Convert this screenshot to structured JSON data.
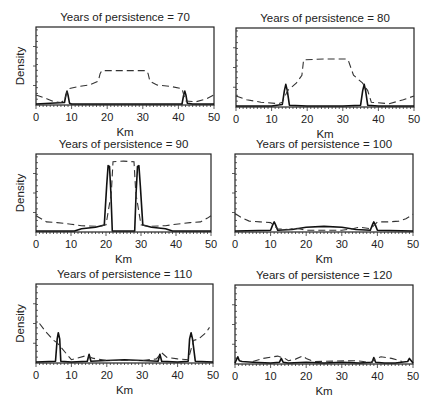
{
  "figure": {
    "xlabel": "Km",
    "ylabel": "Density",
    "xticks": [
      0,
      10,
      20,
      30,
      40,
      50
    ],
    "xlim": [
      0,
      50
    ]
  },
  "chart_data": [
    {
      "type": "line",
      "title": "Years of persistence = 70",
      "xlabel": "Km",
      "ylabel": "Density",
      "xlim": [
        0,
        50
      ],
      "ylim": [
        0,
        1
      ],
      "series": [
        {
          "name": "solid",
          "style": "solid",
          "x": [
            0,
            4,
            8,
            8.4,
            8.7,
            9.0,
            9.4,
            10,
            20,
            30,
            41,
            41.5,
            41.8,
            42.1,
            42.5,
            44,
            50
          ],
          "values": [
            0.0,
            0.01,
            0.02,
            0.12,
            0.17,
            0.12,
            0.01,
            0.0,
            0.0,
            0.0,
            0.0,
            0.12,
            0.17,
            0.12,
            0.01,
            0.0,
            0.0
          ]
        },
        {
          "name": "dashed",
          "style": "dashed",
          "x": [
            0,
            3,
            5,
            7,
            8,
            9,
            12,
            15,
            17.5,
            18,
            18.5,
            25,
            31,
            31.5,
            32,
            34,
            38,
            41,
            42,
            45,
            48,
            50
          ],
          "values": [
            0.12,
            0.07,
            0.03,
            0.02,
            0.05,
            0.2,
            0.23,
            0.25,
            0.3,
            0.4,
            0.44,
            0.44,
            0.44,
            0.4,
            0.3,
            0.25,
            0.23,
            0.2,
            0.04,
            0.03,
            0.07,
            0.12
          ]
        }
      ]
    },
    {
      "type": "line",
      "title": "Years of persistence = 80",
      "xlabel": "Km",
      "ylabel": "",
      "xlim": [
        0,
        50
      ],
      "ylim": [
        0,
        1
      ],
      "series": [
        {
          "name": "solid",
          "style": "solid",
          "x": [
            0,
            10,
            13,
            13.6,
            14,
            14.4,
            15,
            20,
            30,
            35,
            35.6,
            36,
            36.4,
            37,
            40,
            50
          ],
          "values": [
            0.0,
            0.0,
            0.02,
            0.2,
            0.28,
            0.2,
            0.01,
            0.0,
            0.0,
            0.01,
            0.2,
            0.28,
            0.2,
            0.01,
            0.0,
            0.0
          ]
        },
        {
          "name": "dashed",
          "style": "dashed",
          "x": [
            0,
            3,
            7,
            12,
            13,
            14.5,
            17,
            18.5,
            19,
            25,
            31,
            31.5,
            33,
            35.5,
            37,
            38,
            43,
            47,
            50
          ],
          "values": [
            0.13,
            0.08,
            0.05,
            0.03,
            0.05,
            0.2,
            0.3,
            0.4,
            0.6,
            0.61,
            0.61,
            0.6,
            0.4,
            0.3,
            0.2,
            0.05,
            0.03,
            0.08,
            0.13
          ]
        }
      ]
    },
    {
      "type": "line",
      "title": "Years of persistence = 90",
      "xlabel": "Km",
      "ylabel": "Density",
      "xlim": [
        0,
        50
      ],
      "ylim": [
        0,
        1
      ],
      "series": [
        {
          "name": "solid",
          "style": "solid",
          "x": [
            0,
            11,
            13,
            17,
            19.5,
            20.2,
            20.6,
            21.0,
            21.4,
            21.8,
            25,
            28.2,
            28.6,
            29.0,
            29.4,
            29.8,
            30.5,
            33,
            37,
            39,
            50
          ],
          "values": [
            0.0,
            0.0,
            0.03,
            0.05,
            0.08,
            0.6,
            0.86,
            0.85,
            0.5,
            0.0,
            0.0,
            0.0,
            0.5,
            0.85,
            0.86,
            0.6,
            0.08,
            0.05,
            0.03,
            0.0,
            0.0
          ]
        },
        {
          "name": "dashed",
          "style": "dashed",
          "x": [
            0,
            3,
            6,
            10,
            13,
            18,
            20,
            21.5,
            22,
            25,
            28,
            28.5,
            30,
            32,
            37,
            40,
            44,
            47,
            49,
            50
          ],
          "values": [
            0.2,
            0.12,
            0.11,
            0.09,
            0.07,
            0.06,
            0.08,
            0.5,
            0.91,
            0.92,
            0.91,
            0.5,
            0.08,
            0.06,
            0.07,
            0.09,
            0.11,
            0.12,
            0.17,
            0.2
          ]
        }
      ]
    },
    {
      "type": "line",
      "title": "Years of persistence = 100",
      "xlabel": "Km",
      "ylabel": "",
      "xlim": [
        0,
        50
      ],
      "ylim": [
        0,
        1
      ],
      "series": [
        {
          "name": "solid",
          "style": "solid",
          "x": [
            0,
            10,
            10.6,
            11,
            11.4,
            12,
            16,
            20,
            25,
            30,
            34,
            38,
            38.6,
            39,
            39.4,
            40,
            50
          ],
          "values": [
            0.0,
            0.01,
            0.08,
            0.12,
            0.08,
            0.01,
            0.02,
            0.05,
            0.06,
            0.05,
            0.02,
            0.01,
            0.08,
            0.12,
            0.08,
            0.01,
            0.0
          ]
        },
        {
          "name": "dashed",
          "style": "dashed",
          "x": [
            0,
            2,
            4,
            7,
            10,
            11,
            12,
            15,
            17,
            20,
            30,
            33,
            35,
            38,
            39,
            40,
            43,
            46,
            48,
            50
          ],
          "values": [
            0.23,
            0.17,
            0.13,
            0.12,
            0.11,
            0.07,
            0.03,
            0.02,
            0.04,
            0.01,
            0.01,
            0.03,
            0.05,
            0.03,
            0.07,
            0.12,
            0.12,
            0.13,
            0.16,
            0.22
          ]
        }
      ]
    },
    {
      "type": "line",
      "title": "Years of persistence = 110",
      "xlabel": "Km",
      "ylabel": "Density",
      "xlim": [
        0,
        50
      ],
      "ylim": [
        0,
        1
      ],
      "series": [
        {
          "name": "solid",
          "style": "solid",
          "x": [
            0,
            5.5,
            6,
            6.3,
            6.7,
            7,
            10,
            14.5,
            15,
            15.5,
            20,
            25,
            30,
            34.5,
            35,
            35.5,
            40,
            43,
            43.4,
            43.8,
            44.2,
            45,
            50
          ],
          "values": [
            0.0,
            0.01,
            0.3,
            0.38,
            0.3,
            0.01,
            0.0,
            0.01,
            0.1,
            0.01,
            0.02,
            0.03,
            0.02,
            0.01,
            0.1,
            0.01,
            0.0,
            0.01,
            0.3,
            0.38,
            0.3,
            0.01,
            0.0
          ]
        },
        {
          "name": "dashed",
          "style": "dashed",
          "x": [
            1,
            3,
            5,
            6,
            10,
            14,
            16,
            17,
            20,
            30,
            34,
            35.5,
            37,
            40,
            43,
            44.5,
            46,
            48,
            49
          ],
          "values": [
            0.5,
            0.38,
            0.28,
            0.25,
            0.03,
            0.08,
            0.05,
            0.04,
            0.02,
            0.02,
            0.04,
            0.12,
            0.06,
            0.04,
            0.03,
            0.28,
            0.3,
            0.38,
            0.45
          ]
        }
      ]
    },
    {
      "type": "line",
      "title": "Years of persistence = 120",
      "xlabel": "Km",
      "ylabel": "",
      "xlim": [
        0,
        50
      ],
      "ylim": [
        0,
        1
      ],
      "series": [
        {
          "name": "solid",
          "style": "solid",
          "x": [
            0,
            0.8,
            1.2,
            2,
            5,
            10,
            12.5,
            13,
            13.5,
            15,
            20,
            25,
            30,
            35,
            38.5,
            39,
            39.5,
            42,
            45,
            48.5,
            49,
            50
          ],
          "values": [
            0.0,
            0.08,
            0.03,
            0.02,
            0.01,
            0.0,
            0.01,
            0.06,
            0.01,
            0.0,
            0.01,
            0.0,
            0.01,
            0.0,
            0.01,
            0.07,
            0.01,
            0.0,
            0.0,
            0.02,
            0.06,
            0.0
          ]
        },
        {
          "name": "dashed",
          "style": "dashed",
          "x": [
            5,
            8,
            12,
            14,
            15,
            17,
            19,
            20,
            22,
            34,
            36,
            38,
            39.5,
            41,
            44,
            47
          ],
          "values": [
            0.02,
            0.06,
            0.09,
            0.06,
            0.03,
            0.05,
            0.09,
            0.06,
            0.02,
            0.03,
            0.02,
            0.0,
            0.06,
            0.08,
            0.06,
            0.02
          ]
        }
      ]
    }
  ]
}
